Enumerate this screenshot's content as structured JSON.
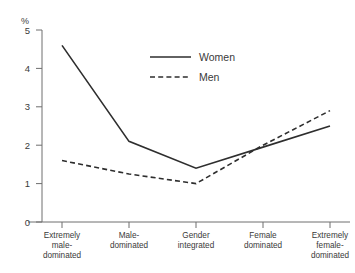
{
  "chart_data": {
    "type": "line",
    "title": "",
    "xlabel": "",
    "ylabel": "%",
    "ylim": [
      0,
      5
    ],
    "yticks": [
      "0",
      "1",
      "2",
      "3",
      "4",
      "5"
    ],
    "grid": false,
    "legend_position": "upper-center",
    "categories": [
      "Extremely male-dominated",
      "Male-dominated",
      "Gender integrated",
      "Female dominated",
      "Extremely female-dominated"
    ],
    "category_lines": [
      [
        "Extremely",
        "male-",
        "dominated"
      ],
      [
        "Male-",
        "dominated"
      ],
      [
        "Gender",
        "integrated"
      ],
      [
        "Female",
        "dominated"
      ],
      [
        "Extremely",
        "female-",
        "dominated"
      ]
    ],
    "series": [
      {
        "name": "Women",
        "style": "solid",
        "color": "#2e2e2e",
        "values": [
          4.6,
          2.1,
          1.4,
          1.95,
          2.5
        ]
      },
      {
        "name": "Men",
        "style": "dashed",
        "color": "#2e2e2e",
        "values": [
          1.6,
          1.25,
          1.0,
          2.0,
          2.9
        ]
      }
    ]
  },
  "axis": {
    "unit_label": "%",
    "y_tick_labels": [
      "5",
      "4",
      "3",
      "2",
      "1",
      "0"
    ]
  },
  "legend": {
    "items": [
      {
        "label": "Women",
        "style": "solid"
      },
      {
        "label": "Men",
        "style": "dashed"
      }
    ]
  },
  "clipped_header": {
    "text": ""
  }
}
